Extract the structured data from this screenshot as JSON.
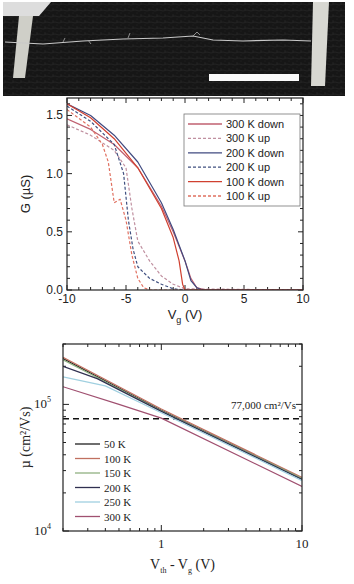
{
  "micrograph": {
    "description": "SEM image of a nanotube bridging two electrodes",
    "scale_bar": "white scale bar (unlabeled)"
  },
  "chart_data": [
    {
      "type": "line",
      "title": "",
      "xlabel": "V_g (V)",
      "xlabel_main": "V",
      "xlabel_sub": "g",
      "xlabel_unit": " (V)",
      "ylabel": "G (µS)",
      "xlim": [
        -10,
        10
      ],
      "ylim": [
        0,
        1.65
      ],
      "xticks": [
        -10,
        -5,
        0,
        5,
        10
      ],
      "xtick_labels": [
        "-10",
        "-5",
        "0",
        "5",
        "10"
      ],
      "yticks": [
        0.0,
        0.5,
        1.0,
        1.5
      ],
      "ytick_labels": [
        "0.0",
        "0.5",
        "1.0",
        "1.5"
      ],
      "grid": false,
      "legend_position": "upper right",
      "series": [
        {
          "name": "300 K down",
          "color": "#c06070",
          "dash": "solid",
          "x": [
            -10,
            -8,
            -6,
            -4,
            -2,
            -1,
            0,
            0.5,
            1,
            1.5,
            2,
            10
          ],
          "y": [
            1.47,
            1.38,
            1.25,
            1.05,
            0.72,
            0.5,
            0.25,
            0.1,
            0.02,
            0.005,
            0,
            0
          ]
        },
        {
          "name": "300 K up",
          "color": "#c090a0",
          "dash": "dashed",
          "x": [
            -10,
            -8,
            -6,
            -5,
            -4.5,
            -4,
            -3,
            -2,
            -1,
            0,
            10
          ],
          "y": [
            1.42,
            1.33,
            1.2,
            1.05,
            0.7,
            0.42,
            0.25,
            0.12,
            0.05,
            0.01,
            0
          ]
        },
        {
          "name": "200 K down",
          "color": "#404a80",
          "dash": "solid",
          "x": [
            -10,
            -8,
            -6,
            -4,
            -2,
            -1,
            0,
            0.5,
            1,
            1.5,
            10
          ],
          "y": [
            1.6,
            1.5,
            1.33,
            1.1,
            0.75,
            0.52,
            0.25,
            0.08,
            0.02,
            0,
            0
          ]
        },
        {
          "name": "200 K up",
          "color": "#405080",
          "dash": "dashed",
          "x": [
            -10,
            -8,
            -6,
            -5.2,
            -4.8,
            -4.4,
            -4,
            -3,
            -2,
            -1,
            0,
            10
          ],
          "y": [
            1.58,
            1.45,
            1.25,
            1.0,
            0.6,
            0.35,
            0.2,
            0.1,
            0.05,
            0.01,
            0,
            0
          ]
        },
        {
          "name": "100 K down",
          "color": "#d04030",
          "dash": "solid",
          "x": [
            -10,
            -8,
            -6,
            -4,
            -2,
            -1,
            -0.5,
            -0.2,
            0,
            10
          ],
          "y": [
            1.6,
            1.48,
            1.3,
            1.05,
            0.7,
            0.45,
            0.25,
            0.05,
            0,
            0
          ]
        },
        {
          "name": "100 K up",
          "color": "#e07060",
          "dash": "dashed",
          "x": [
            -10,
            -8,
            -7,
            -6.5,
            -6,
            -5.5,
            -5,
            -4.5,
            -4,
            -3.5,
            -3,
            10
          ],
          "y": [
            1.55,
            1.4,
            1.25,
            1.1,
            0.75,
            0.78,
            0.6,
            0.3,
            0.1,
            0.02,
            0,
            0
          ]
        }
      ]
    },
    {
      "type": "line",
      "title": "",
      "xlabel": "V_th - V_g (V)",
      "xlabel_parts": [
        "V",
        "th",
        " - V",
        "g",
        " (V)"
      ],
      "ylabel": "µ (cm²/Vs)",
      "xscale": "log",
      "yscale": "log",
      "xlim": [
        0.2,
        10
      ],
      "ylim": [
        10000,
        300000
      ],
      "xticks": [
        1,
        10
      ],
      "xtick_labels": [
        "1",
        "10"
      ],
      "yticks": [
        10000,
        100000
      ],
      "ytick_labels": [
        "10",
        "10"
      ],
      "ytick_exponents": [
        "4",
        "5"
      ],
      "grid": false,
      "legend_position": "lower left",
      "annotations": [
        {
          "text": "77,000 cm²/Vs",
          "type": "horizontal dashed line",
          "y": 77000
        }
      ],
      "series": [
        {
          "name": "50 K",
          "color": "#202020",
          "x": [
            0.2,
            1,
            10
          ],
          "y": [
            230000,
            90000,
            26000
          ]
        },
        {
          "name": "100 K",
          "color": "#c07060",
          "x": [
            0.2,
            1,
            10
          ],
          "y": [
            235000,
            92000,
            26500
          ]
        },
        {
          "name": "150 K",
          "color": "#90b080",
          "x": [
            0.2,
            1,
            10
          ],
          "y": [
            225000,
            89000,
            26000
          ]
        },
        {
          "name": "200 K",
          "color": "#303050",
          "x": [
            0.2,
            0.35,
            1,
            10
          ],
          "y": [
            200000,
            160000,
            88000,
            25500
          ]
        },
        {
          "name": "250 K",
          "color": "#a0d0e0",
          "x": [
            0.2,
            0.4,
            1,
            10
          ],
          "y": [
            165000,
            140000,
            86000,
            25000
          ]
        },
        {
          "name": "300 K",
          "color": "#a05070",
          "x": [
            0.2,
            0.5,
            1,
            10
          ],
          "y": [
            138000,
            100000,
            78000,
            22500
          ]
        }
      ]
    }
  ]
}
